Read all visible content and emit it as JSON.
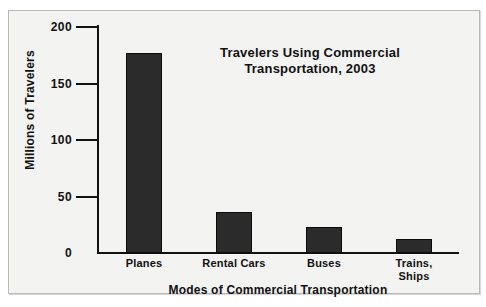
{
  "chart_data": {
    "type": "bar",
    "title": "Travelers Using Commercial Transportation, 2003",
    "title_lines": [
      "Travelers Using Commercial",
      "Transportation, 2003"
    ],
    "xlabel": "Modes of Commercial Transportation",
    "ylabel": "Millions of Travelers",
    "categories": [
      "Planes",
      "Rental Cars",
      "Buses",
      "Trains, Ships"
    ],
    "category_label_lines": [
      [
        "Planes"
      ],
      [
        "Rental Cars"
      ],
      [
        "Buses"
      ],
      [
        "Trains,",
        "Ships"
      ]
    ],
    "values": [
      177,
      36,
      23,
      12
    ],
    "ylim": [
      0,
      200
    ],
    "yticks": [
      0,
      50,
      100,
      150,
      200
    ],
    "ytick_labels": [
      "0",
      "50",
      "100",
      "150",
      "200"
    ],
    "grid": false,
    "legend": false,
    "bar_color": "#2b2b2b",
    "axis_color": "#111111",
    "background_color": "#f3f3f1",
    "frame_border_color": "#b9b9b7"
  },
  "ticks": [
    {
      "label": "200",
      "value": 200
    },
    {
      "label": "150",
      "value": 150
    },
    {
      "label": "100",
      "value": 100
    },
    {
      "label": "50",
      "value": 50
    },
    {
      "label": "0",
      "value": 0
    }
  ],
  "bars": [
    {
      "label_line1": "Planes",
      "label_line2": "",
      "value": 177
    },
    {
      "label_line1": "Rental Cars",
      "label_line2": "",
      "value": 36
    },
    {
      "label_line1": "Buses",
      "label_line2": "",
      "value": 23
    },
    {
      "label_line1": "Trains,",
      "label_line2": "Ships",
      "value": 12
    }
  ],
  "title": {
    "line1": "Travelers Using Commercial",
    "line2": "Transportation, 2003"
  },
  "axes": {
    "y_title": "Millions of Travelers",
    "x_title": "Modes of Commercial Transportation"
  }
}
